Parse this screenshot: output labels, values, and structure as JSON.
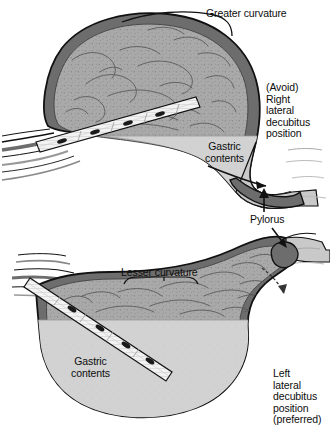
{
  "figure": {
    "background_color": "#ffffff"
  },
  "colors": {
    "outline": "#111111",
    "stomach_wall": "#6d6d6d",
    "stomach_wall_light": "#8a8a8a",
    "mucosa": "#a9a9a9",
    "mucosa_dark": "#7a7a7a",
    "rugae_line": "#555555",
    "gastric_fluid": "#d2d2d2",
    "duodenum_fill": "#c9c9c9",
    "tube_body": "#f2f2f2",
    "tube_mark": "#1a1a1a",
    "text": "#0d0d0d"
  },
  "panels": [
    {
      "id": "top-panel",
      "name": "right-lateral-decubitus-panel",
      "position_label": "(Avoid)\nRight\nlateral\ndecubitus\nposition",
      "curvature_label": "Greater curvature",
      "gastric_contents_label": "Gastric\ncontents",
      "pylorus_label": "Pylorus",
      "fluid_level_description": "Gastric contents pool in dependent pyloric antrum and drain toward duodenum",
      "tube_description": "Nasogastric tube tip lies above the fluid level in the gastric air space"
    },
    {
      "id": "bottom-panel",
      "name": "left-lateral-decubitus-panel",
      "position_label": "Left\nlateral\ndecubitus\nposition\n(preferred)",
      "curvature_label": "Lesser curvature",
      "gastric_contents_label": "Gastric\ncontents",
      "pylorus_label": "Pylorus",
      "fluid_level_description": "Gastric contents pool in dependent fundus and greater curvature away from pylorus",
      "tube_description": "Nasogastric tube tip descends into the dependent gastric fluid pool"
    }
  ],
  "labels": {
    "greater_curvature": "Greater curvature",
    "lesser_curvature": "Lesser curvature",
    "gastric_contents_top_line1": "Gastric",
    "gastric_contents_top_line2": "contents",
    "gastric_contents_bottom_line1": "Gastric",
    "gastric_contents_bottom_line2": "contents",
    "pylorus_top": "Pylorus",
    "pylorus_bottom": "Pylorus",
    "right_position_line1": "(Avoid)",
    "right_position_line2": "Right",
    "right_position_line3": "lateral",
    "right_position_line4": "decubitus",
    "right_position_line5": "position",
    "left_position_line1": "Left",
    "left_position_line2": "lateral",
    "left_position_line3": "decubitus",
    "left_position_line4": "position",
    "left_position_line5": "(preferred)"
  }
}
